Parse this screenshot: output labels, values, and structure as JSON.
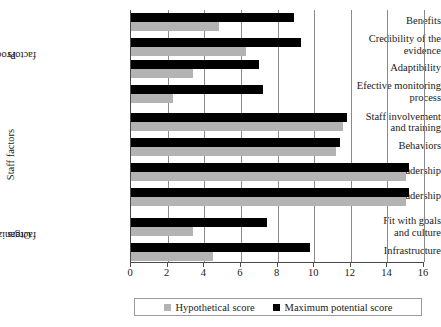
{
  "chart_data": {
    "type": "bar",
    "orientation": "horizontal",
    "title": "",
    "xlabel": "",
    "ylabel": "",
    "xlim": [
      0,
      16
    ],
    "xticks": [
      0,
      2,
      4,
      6,
      8,
      10,
      12,
      14,
      16
    ],
    "grid": true,
    "legend_position": "bottom",
    "legend": [
      "Hypothetical score",
      "Maximum potential score"
    ],
    "groups": [
      {
        "name": "Process factors",
        "categories": [
          "Benefits",
          "Credibility of the evidence",
          "Adaptibility",
          "Efective monitoring process"
        ]
      },
      {
        "name": "Staff factors",
        "categories": [
          "Staff involvement and training",
          "Behaviors",
          "Senior leadership",
          "Clinical leadership"
        ]
      },
      {
        "name": "Organizational factors",
        "categories": [
          "Fit with goals and culture",
          "Infrastructure"
        ]
      }
    ],
    "categories": [
      "Benefits",
      "Credibility of the evidence",
      "Adaptibility",
      "Efective monitoring process",
      "Staff involvement and training",
      "Behaviors",
      "Senior leadership",
      "Clinical leadership",
      "Fit with goals and culture",
      "Infrastructure"
    ],
    "series": [
      {
        "name": "Maximum potential score",
        "color": "#000000",
        "values": [
          8.9,
          9.3,
          7.0,
          7.2,
          11.8,
          11.4,
          15.2,
          15.2,
          7.4,
          9.8
        ]
      },
      {
        "name": "Hypothetical score",
        "color": "#b3b3b3",
        "values": [
          4.8,
          6.3,
          3.4,
          2.3,
          11.6,
          11.2,
          15.0,
          15.0,
          3.4,
          4.5
        ]
      }
    ]
  },
  "axis": {
    "tick_labels": [
      "0",
      "2",
      "4",
      "6",
      "8",
      "10",
      "12",
      "14",
      "16"
    ]
  },
  "category_labels": {
    "benefits": "Benefits",
    "credibility_line1": "Credibility of the",
    "credibility_line2": "evidence",
    "adaptibility": "Adaptibility",
    "monitoring_line1": "Efective monitoring",
    "monitoring_line2": "process",
    "staff_involvement_line1": "Staff involvement",
    "staff_involvement_line2": "and training",
    "behaviors": "Behaviors",
    "senior_leadership": "Senior leadership",
    "clinical_leadership": "Clinical leadership",
    "fit_line1": "Fit with goals",
    "fit_line2": "and culture",
    "infrastructure": "Infrastructure"
  },
  "group_labels": {
    "process_line1": "Process",
    "process_line2": "factors",
    "staff": "Staff factors",
    "org_line1": "Organizational",
    "org_line2": "factors"
  },
  "legend": {
    "hypothetical": "Hypothetical score",
    "maximum": "Maximum potential score"
  }
}
